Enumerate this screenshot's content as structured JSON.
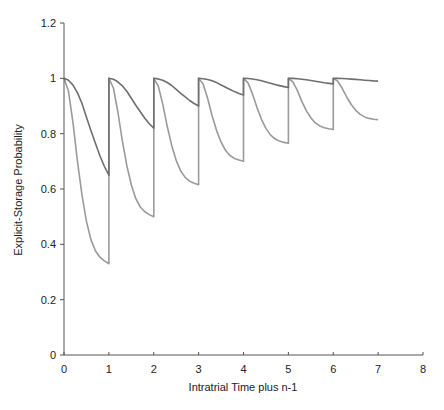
{
  "chart_data": {
    "type": "line",
    "title": "",
    "xlabel": "Intratrial Time plus n-1",
    "ylabel": "Explicit-Storage Probability",
    "xlim": [
      0,
      8
    ],
    "ylim": [
      0,
      1.2
    ],
    "x_ticks": [
      0,
      1,
      2,
      3,
      4,
      5,
      6,
      7,
      8
    ],
    "y_ticks": [
      0,
      0.2,
      0.4,
      0.6,
      0.8,
      1,
      1.2
    ],
    "y_tick_labels": [
      "0",
      "0.2",
      "0.4",
      "0.6",
      "0.8",
      "1",
      "1.2"
    ],
    "grid": false,
    "legend": null,
    "series": [
      {
        "name": "slow decay (dark)",
        "color": "#6f6f6f",
        "interval_start_value": 1.0,
        "interval_end_values": [
          0.65,
          0.82,
          0.9,
          0.94,
          0.967,
          0.98,
          0.99
        ],
        "profile_t": [
          0,
          0.1,
          0.2,
          0.3,
          0.4,
          0.5,
          0.6,
          0.7,
          0.8,
          0.9,
          1.0
        ],
        "profile_frac": [
          1.0,
          0.98,
          0.93,
          0.85,
          0.74,
          0.6,
          0.46,
          0.33,
          0.2,
          0.09,
          0.0
        ]
      },
      {
        "name": "fast decay (light)",
        "color": "#9a9a9a",
        "interval_start_value": 1.0,
        "interval_end_values": [
          0.33,
          0.5,
          0.615,
          0.7,
          0.765,
          0.815,
          0.85
        ],
        "profile_t": [
          0,
          0.1,
          0.2,
          0.3,
          0.4,
          0.5,
          0.6,
          0.7,
          0.8,
          0.9,
          1.0
        ],
        "profile_frac": [
          1.0,
          0.93,
          0.76,
          0.55,
          0.37,
          0.23,
          0.13,
          0.07,
          0.035,
          0.015,
          0.0
        ]
      }
    ]
  }
}
